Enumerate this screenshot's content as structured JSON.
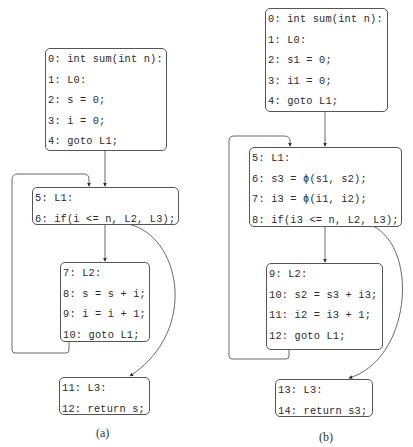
{
  "panels": {
    "a": {
      "caption": "(a)",
      "blocks": [
        {
          "lines": [
            "0: int sum(int n):",
            "1: L0:",
            "2: s = 0;",
            "3: i = 0;",
            "4: goto L1;"
          ]
        },
        {
          "lines": [
            "5: L1:",
            "6: if(i <= n, L2, L3);"
          ]
        },
        {
          "lines": [
            "7: L2:",
            "8: s = s + i;",
            "9: i = i + 1;",
            "10: goto L1;"
          ]
        },
        {
          "lines": [
            "11: L3:",
            "12: return s;"
          ]
        }
      ]
    },
    "b": {
      "caption": "(b)",
      "blocks": [
        {
          "lines": [
            "0: int sum(int n):",
            "1: L0:",
            "2: s1 = 0;",
            "3: i1 = 0;",
            "4: goto L1;"
          ]
        },
        {
          "lines": [
            "5: L1:",
            "6: s3 = ϕ(s1, s2);",
            "7: i3 = ϕ(i1, i2);",
            "8: if(i3 <= n, L2, L3);"
          ]
        },
        {
          "lines": [
            "9: L2:",
            "10: s2 = s3 + i3;",
            "11: i2 = i3 + 1;",
            "12: goto L1;"
          ]
        },
        {
          "lines": [
            "13: L3:",
            "14: return s3;"
          ]
        }
      ]
    }
  },
  "edges": {
    "a": [
      "block0->block1",
      "block1->block2",
      "block1->block3",
      "block2->block1 (back edge)"
    ],
    "b": [
      "block0->block1",
      "block1->block2",
      "block1->block3",
      "block2->block1 (back edge)"
    ]
  },
  "colors": {
    "border": "#555555",
    "edge": "#444444",
    "text": "#2a2a2a"
  }
}
